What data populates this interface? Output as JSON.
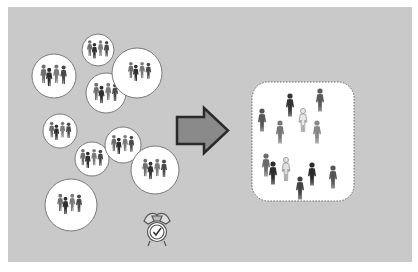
{
  "diagram": {
    "background_color": "#c9c9c9",
    "small_groups": [
      {
        "cx": 54,
        "cy": 76,
        "r": 22,
        "people": 4
      },
      {
        "cx": 98,
        "cy": 50,
        "r": 16,
        "people": 4
      },
      {
        "cx": 106,
        "cy": 93,
        "r": 20,
        "people": 4
      },
      {
        "cx": 137,
        "cy": 73,
        "r": 25,
        "people": 4
      },
      {
        "cx": 60,
        "cy": 131,
        "r": 17,
        "people": 4
      },
      {
        "cx": 92,
        "cy": 159,
        "r": 17,
        "people": 4
      },
      {
        "cx": 123,
        "cy": 145,
        "r": 18,
        "people": 4
      },
      {
        "cx": 155,
        "cy": 170,
        "r": 24,
        "people": 4
      },
      {
        "cx": 71,
        "cy": 205,
        "r": 26,
        "people": 4
      }
    ],
    "arrow": {
      "direction": "right",
      "fill": "#8a8a8a",
      "stroke": "#2a2a2a"
    },
    "large_group": {
      "x": 252,
      "y": 82,
      "width": 102,
      "height": 119,
      "people": 13,
      "border": "dotted"
    },
    "icons": [
      "person-icon",
      "right-arrow-icon",
      "alarm-clock-icon"
    ]
  }
}
